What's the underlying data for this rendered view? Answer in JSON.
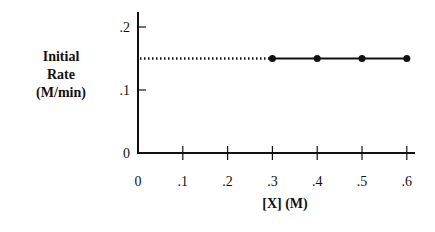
{
  "chart_data": {
    "type": "line",
    "title": "",
    "xlabel": "[X] (M)",
    "ylabel": "Initial Rate (M/min)",
    "ylabel_lines": [
      "Initial",
      "Rate",
      "(M/min)"
    ],
    "x_ticks": [
      "0",
      ".1",
      ".2",
      ".3",
      ".4",
      ".5",
      ".6"
    ],
    "y_ticks": [
      "0",
      ".1",
      ".2"
    ],
    "xlim": [
      0,
      0.62
    ],
    "ylim": [
      0,
      0.22
    ],
    "grid": false,
    "legend": null,
    "series": [
      {
        "name": "measured",
        "style": "solid with markers",
        "x": [
          0.3,
          0.4,
          0.5,
          0.6
        ],
        "y": [
          0.15,
          0.15,
          0.15,
          0.15
        ]
      },
      {
        "name": "extrapolated",
        "style": "dotted",
        "x": [
          0,
          0.3
        ],
        "y": [
          0.15,
          0.15
        ]
      }
    ]
  }
}
